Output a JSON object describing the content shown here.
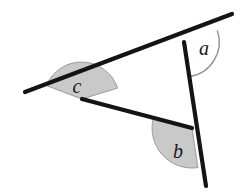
{
  "figure": {
    "type": "geometry-diagram",
    "background_color": "#ffffff",
    "line_color": "#141414",
    "sector_fill_color": "#c9c9c9",
    "sector_stroke_color": "#8f8f8f",
    "arc_stroke_color": "#8f8f8f",
    "label_color": "#1a1a1a",
    "vertices": [
      {
        "name": "top-vertex",
        "label": "a",
        "x": 184,
        "y": 42
      },
      {
        "name": "left-vertex",
        "label": "c",
        "x": 82,
        "y": 99
      },
      {
        "name": "bottom-vertex",
        "label": "b",
        "x": 192,
        "y": 128
      }
    ],
    "segments": [
      {
        "name": "upper-ray-extended",
        "x1": 25,
        "y1": 92,
        "x2": 232,
        "y2": 14,
        "width": 4
      },
      {
        "name": "left-lower-edge",
        "x1": 82,
        "y1": 99,
        "x2": 192,
        "y2": 128,
        "width": 4
      },
      {
        "name": "right-vertical-ray",
        "x1": 184,
        "y1": 42,
        "x2": 206,
        "y2": 186,
        "width": 4
      }
    ],
    "angle_marks": [
      {
        "name": "angle-a-arc",
        "label": "a",
        "style": "open-arc",
        "cx": 184,
        "cy": 42,
        "radius": 35,
        "label_x": 205,
        "label_y": 54
      },
      {
        "name": "angle-c-sector",
        "label": "c",
        "style": "filled-sector",
        "cx": 82,
        "cy": 99,
        "radius": 36,
        "label_x": 76,
        "label_y": 92
      },
      {
        "name": "angle-b-sector",
        "label": "b",
        "style": "filled-sector",
        "cx": 192,
        "cy": 128,
        "radius": 40,
        "label_x": 177,
        "label_y": 155
      }
    ],
    "labels": {
      "a": "a",
      "b": "b",
      "c": "c"
    }
  }
}
